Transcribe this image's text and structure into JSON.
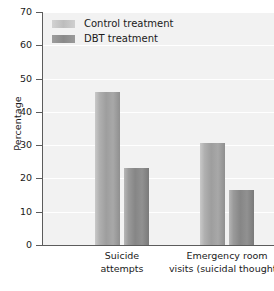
{
  "chart_data": {
    "type": "bar",
    "title": "",
    "xlabel": "",
    "ylabel": "Percentage",
    "ylim": [
      0,
      70
    ],
    "yticks": [
      0,
      10,
      20,
      30,
      40,
      50,
      60,
      70
    ],
    "grid": true,
    "legend_position": "top-left",
    "categories": [
      "Suicide attempts",
      "Emergency room visits (suicidal thoughts)"
    ],
    "category_lines": [
      [
        "Suicide",
        "attempts"
      ],
      [
        "Emergency room",
        "visits (suicidal thoughts)"
      ]
    ],
    "series": [
      {
        "name": "Control treatment",
        "values": [
          46,
          30.5
        ],
        "color": "#9e9e9e"
      },
      {
        "name": "DBT treatment",
        "values": [
          23,
          16.5
        ],
        "color": "#868686"
      }
    ]
  },
  "legend": {
    "items": [
      {
        "label": "Control treatment"
      },
      {
        "label": "DBT treatment"
      }
    ]
  },
  "axis": {
    "y_title": "Percentage",
    "y_tick_labels": [
      "70",
      "60",
      "50",
      "40",
      "30",
      "20",
      "10",
      "0"
    ]
  },
  "colors": {
    "plot_background": "#f2f2f2",
    "gridline": "#ffffff",
    "axis": "#5c5c5c",
    "text": "#1a1a1a"
  }
}
